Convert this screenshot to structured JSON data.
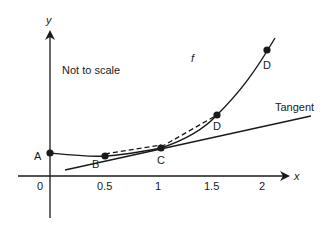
{
  "diagram": {
    "note": "Not to scale",
    "function_label": "f",
    "tangent_label": "Tangent",
    "axes": {
      "x_label": "x",
      "y_label": "y"
    },
    "x_ticks": [
      "0",
      "0.5",
      "1",
      "1.5",
      "2"
    ],
    "points": [
      {
        "label": "A",
        "x": 0
      },
      {
        "label": "B",
        "x": 0.5
      },
      {
        "label": "C",
        "x": 1
      },
      {
        "label": "D",
        "x": 1.5
      },
      {
        "label": "D",
        "x": 2
      }
    ],
    "colors": {
      "stroke": "#1a1a1a",
      "background": "#ffffff"
    }
  }
}
